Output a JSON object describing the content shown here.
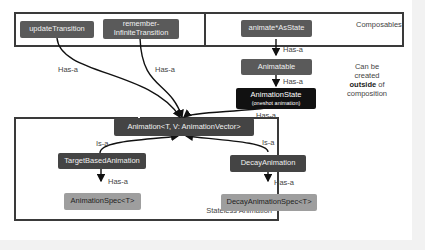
{
  "groups": {
    "composables": "Composables",
    "stateless": "Stateless Animation"
  },
  "side_note": {
    "line1": "Can be",
    "line2": "created",
    "bold": "outside",
    "after_bold": " of",
    "line4": "composition"
  },
  "nodes": {
    "update_transition": "updateTransition",
    "remember_infinite_1": "remember-",
    "remember_infinite_2": "InfiniteTransition",
    "animate_as_state": "animate*AsState",
    "animatable": "Animatable",
    "animation_state": "AnimationState",
    "animation_state_sub": "(oneshot animation)",
    "animation": "Animation<T, V: AnimationVector>",
    "target_based": "TargetBasedAnimation",
    "decay": "DecayAnimation",
    "animation_spec": "AnimationSpec<T>",
    "decay_spec": "DecayAnimationSpec<T>"
  },
  "edges": {
    "has_a": "Has-a",
    "is_a": "Is-a"
  }
}
